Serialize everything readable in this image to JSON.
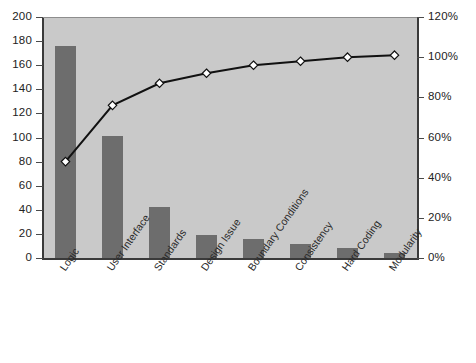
{
  "chart_data": {
    "type": "bar",
    "title": "",
    "subtitle": "",
    "xlabel": "",
    "ylabel": "",
    "categories": [
      "Logic",
      "User Interface",
      "Standards",
      "Design Issue",
      "Boundary Conditions",
      "Consistency",
      "Hard Coding",
      "Modularity"
    ],
    "series": [
      {
        "name": "Defect Count",
        "type": "bar",
        "axis": "left",
        "values": [
          176,
          101,
          42,
          19,
          16,
          12,
          8,
          4
        ]
      },
      {
        "name": "Cumulative Percent",
        "type": "line",
        "axis": "right",
        "values": [
          48,
          76,
          87,
          92,
          96,
          98,
          100,
          101
        ]
      }
    ],
    "left_axis": {
      "label": "",
      "min": 0,
      "max": 200,
      "step": 20,
      "ticks": [
        0,
        20,
        40,
        60,
        80,
        100,
        120,
        140,
        160,
        180,
        200
      ],
      "tick_labels": [
        "0",
        "20",
        "40",
        "60",
        "80",
        "100",
        "120",
        "140",
        "160",
        "180",
        "200"
      ]
    },
    "right_axis": {
      "label": "",
      "min": 0,
      "max": 120,
      "step": 20,
      "ticks": [
        0,
        20,
        40,
        60,
        80,
        100,
        120
      ],
      "tick_labels": [
        "0%",
        "20%",
        "40%",
        "60%",
        "80%",
        "100%",
        "120%"
      ]
    },
    "grid": false,
    "legend": null,
    "colors": {
      "bar": "#6d6d6d",
      "plot_background": "#c9c9c9",
      "line": "#111111",
      "marker_fill": "#ffffff",
      "marker_edge": "#111111",
      "axis": "#3a3a3a",
      "text": "#222222",
      "page_background": "#ffffff"
    }
  }
}
